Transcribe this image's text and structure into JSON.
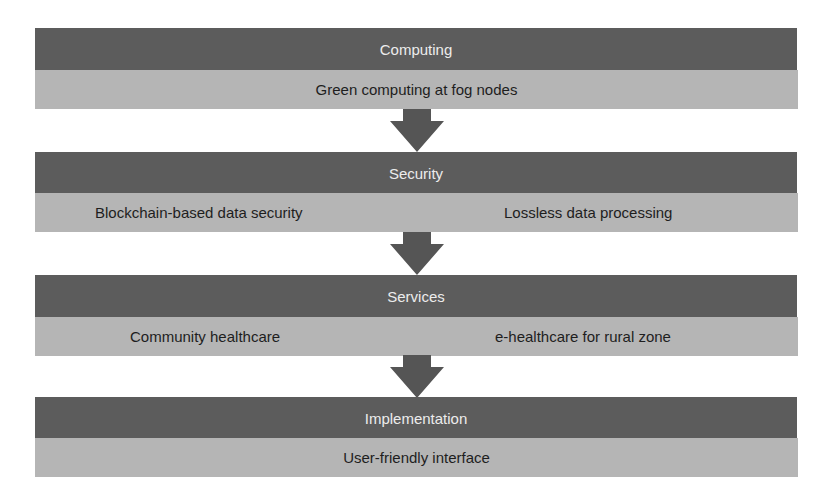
{
  "diagram": {
    "layers": [
      {
        "title": "Computing",
        "items": [
          "Green computing at fog nodes"
        ]
      },
      {
        "title": "Security",
        "items": [
          "Blockchain-based data security",
          "Lossless data processing"
        ]
      },
      {
        "title": "Services",
        "items": [
          "Community healthcare",
          "e-healthcare for rural zone"
        ]
      },
      {
        "title": "Implementation",
        "items": [
          "User-friendly interface"
        ]
      }
    ],
    "colors": {
      "header_band": "#5c5c5c",
      "item_band": "#b5b5b5",
      "arrow": "#555555",
      "header_text": "#ececec",
      "item_text": "#1e1e1e"
    }
  }
}
